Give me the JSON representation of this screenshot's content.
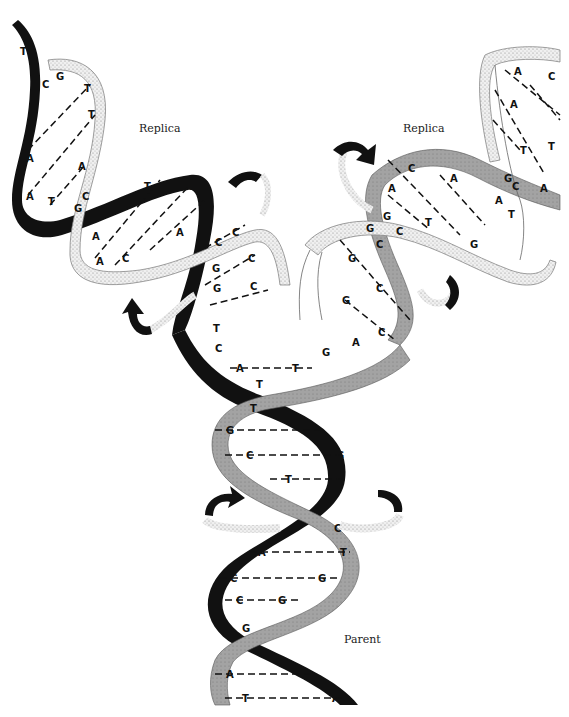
{
  "diagram": {
    "labels": {
      "replica_left": "Replica",
      "replica_right": "Replica",
      "parent": "Parent"
    },
    "colors": {
      "dark_strand": "#111111",
      "gray_strand": "#9a9a9a",
      "light_strand": "#e6e6e6",
      "background": "#ffffff"
    },
    "parent_pairs": [
      {
        "left": "A",
        "right": "T"
      },
      {
        "left": "T",
        "right": ""
      },
      {
        "left": "T",
        "right": ""
      },
      {
        "left": "G",
        "right": "C"
      },
      {
        "left": "C",
        "right": "G"
      },
      {
        "left": "T",
        "right": "A"
      },
      {
        "left": "G",
        "right": "C"
      },
      {
        "left": "A",
        "right": "T"
      },
      {
        "left": "C",
        "right": "G"
      },
      {
        "left": "C",
        "right": "G"
      },
      {
        "left": "G",
        "right": ""
      },
      {
        "left": "T",
        "right": "A"
      },
      {
        "left": "A",
        "right": "T"
      },
      {
        "left": "T",
        "right": "A"
      }
    ],
    "left_replica_bases": [
      "T",
      "C",
      "G",
      "A",
      "T",
      "A",
      "A",
      "T",
      "A",
      "T",
      "G",
      "C",
      "A",
      "T",
      "G",
      "A",
      "C",
      "A",
      "C",
      "G",
      "C",
      "G",
      "C",
      "G",
      "C",
      "T",
      "C"
    ],
    "right_replica_bases": [
      "C",
      "A",
      "A",
      "T",
      "G",
      "C",
      "G",
      "G",
      "C",
      "G",
      "C",
      "G",
      "A",
      "A",
      "C",
      "A",
      "T",
      "A",
      "T",
      "G",
      "C",
      "A",
      "T"
    ]
  }
}
